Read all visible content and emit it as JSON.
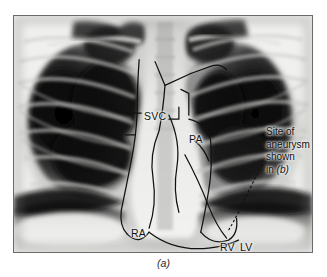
{
  "figure": {
    "caption": "(a)",
    "modality": "chest-radiograph",
    "view": "PA",
    "panel_border_color": "#6a6a6a"
  },
  "labels": [
    {
      "id": "svc",
      "text": "SVC",
      "meaning": "superior vena cava"
    },
    {
      "id": "pa",
      "text": "PA",
      "meaning": "pulmonary artery"
    },
    {
      "id": "ra",
      "text": "RA",
      "meaning": "right atrium"
    },
    {
      "id": "rv",
      "text": "RV",
      "meaning": "right ventricle"
    },
    {
      "id": "lv",
      "text": "LV",
      "meaning": "left ventricle"
    }
  ],
  "callout": {
    "line1": "Site of",
    "line2": "aneurysm",
    "line3": "shown",
    "line4_prefix": "in ",
    "line4_ref": "(b)"
  },
  "colors": {
    "ink": "#101010",
    "overlay_stroke": "#111111",
    "film_light": "#f2f2f0",
    "film_dark": "#0b0b0b",
    "page_background": "#ffffff"
  }
}
